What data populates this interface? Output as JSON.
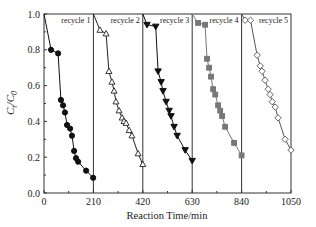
{
  "chart_data": {
    "type": "line",
    "title": "",
    "xlabel": "Reaction Time/min",
    "ylabel": "Ct/C0",
    "xlim": [
      0,
      1050
    ],
    "ylim": [
      0.0,
      1.0
    ],
    "x_ticks": [
      "0",
      "210",
      "420",
      "630",
      "840",
      "1050"
    ],
    "y_ticks": [
      "0.0",
      "0.2",
      "0.4",
      "0.6",
      "0.8",
      "1.0"
    ],
    "grid": false,
    "legend_position": "inline-top-of-each-panel",
    "dividers": [
      210,
      420,
      630,
      840
    ],
    "series": [
      {
        "name": "recycle 1",
        "marker": "filled-circle",
        "color": "#111111",
        "x": [
          0,
          30,
          60,
          72,
          81,
          89,
          98,
          111,
          119,
          128,
          136,
          145,
          179,
          209
        ],
        "y": [
          1.0,
          0.8,
          0.78,
          0.52,
          0.49,
          0.45,
          0.38,
          0.36,
          0.32,
          0.235,
          0.195,
          0.175,
          0.125,
          0.085
        ]
      },
      {
        "name": "recycle 2",
        "marker": "open-triangle-up",
        "color": "#222222",
        "x": [
          210,
          238,
          264,
          276,
          289,
          298,
          306,
          319,
          332,
          340,
          349,
          362,
          374,
          400,
          420
        ],
        "y": [
          1.0,
          0.91,
          0.89,
          0.68,
          0.62,
          0.57,
          0.51,
          0.46,
          0.42,
          0.4,
          0.39,
          0.35,
          0.32,
          0.22,
          0.16
        ]
      },
      {
        "name": "recycle 3",
        "marker": "filled-triangle-down",
        "color": "#111111",
        "x": [
          420,
          438,
          475,
          485,
          498,
          506,
          519,
          532,
          540,
          553,
          566,
          600,
          630
        ],
        "y": [
          1.0,
          0.94,
          0.93,
          0.68,
          0.62,
          0.57,
          0.51,
          0.46,
          0.43,
          0.37,
          0.32,
          0.24,
          0.18
        ]
      },
      {
        "name": "recycle 4",
        "marker": "filled-square",
        "color": "#777777",
        "x": [
          630,
          655,
          685,
          693,
          702,
          710,
          719,
          728,
          740,
          749,
          757,
          770,
          808,
          840
        ],
        "y": [
          1.0,
          0.95,
          0.94,
          0.75,
          0.7,
          0.65,
          0.58,
          0.55,
          0.49,
          0.46,
          0.43,
          0.37,
          0.28,
          0.21
        ]
      },
      {
        "name": "recycle 5",
        "marker": "open-diamond",
        "color": "#555555",
        "x": [
          840,
          855,
          878,
          906,
          919,
          927,
          940,
          953,
          961,
          970,
          983,
          995,
          1025,
          1050
        ],
        "y": [
          1.0,
          0.965,
          0.965,
          0.77,
          0.71,
          0.68,
          0.63,
          0.58,
          0.55,
          0.51,
          0.48,
          0.42,
          0.3,
          0.24
        ]
      }
    ]
  }
}
